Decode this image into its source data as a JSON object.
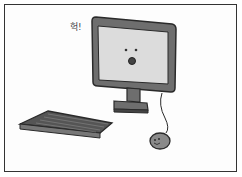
{
  "illustration": {
    "exclamation": "헉!",
    "description": "surprised computer monitor with keyboard and mouse",
    "colors": {
      "outline": "#2a2a2a",
      "bezel": "#6e6e6e",
      "screen": "#dcdcdc",
      "keyboard": "#555555",
      "mouse": "#8a8a8a",
      "background": "#fdfdfd"
    }
  }
}
